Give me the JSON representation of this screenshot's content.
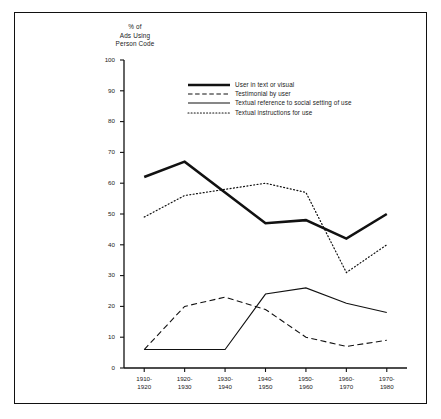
{
  "chart_data": {
    "type": "line",
    "title": "",
    "ylabel": "% of\nAds Using\nPerson Code",
    "xlabel": "",
    "ylim": [
      0,
      100
    ],
    "yticks": [
      0,
      10,
      20,
      30,
      40,
      50,
      60,
      70,
      80,
      90,
      100
    ],
    "grid": false,
    "legend_position": "upper-center",
    "categories": [
      "1910-\n1920",
      "1920-\n1930",
      "1930-\n1940",
      "1940-\n1950",
      "1950-\n1960",
      "1960-\n1970",
      "1970-\n1980"
    ],
    "series": [
      {
        "name": "User in text or visual",
        "style": "thick-solid",
        "values": [
          62,
          67,
          57,
          47,
          48,
          42,
          50
        ]
      },
      {
        "name": "Testimonial by user",
        "style": "dashed",
        "values": [
          6,
          20,
          23,
          19,
          10,
          7,
          9
        ]
      },
      {
        "name": "Textual reference to social setting of use",
        "style": "thin-solid",
        "values": [
          6,
          6,
          6,
          24,
          26,
          21,
          18
        ]
      },
      {
        "name": "Textual instructions for use",
        "style": "dotted",
        "values": [
          49,
          56,
          58,
          60,
          57,
          31,
          40
        ]
      }
    ]
  },
  "axis": {
    "y_tick_labels": [
      "100",
      "90",
      "80",
      "70",
      "60",
      "50",
      "40",
      "30",
      "20",
      "10",
      "0"
    ],
    "y_title": "% of\nAds Using\nPerson Code"
  },
  "legend": {
    "items": [
      {
        "label": "User in text or visual",
        "key": "thick-solid-line-icon"
      },
      {
        "label": "Testimonial by user",
        "key": "dashed-line-icon"
      },
      {
        "label": "Textual reference to social setting of use",
        "key": "thin-solid-line-icon"
      },
      {
        "label": "Textual instructions for use",
        "key": "dotted-line-icon"
      }
    ]
  },
  "colors": {
    "ink": "#111111",
    "background": "#ffffff"
  }
}
